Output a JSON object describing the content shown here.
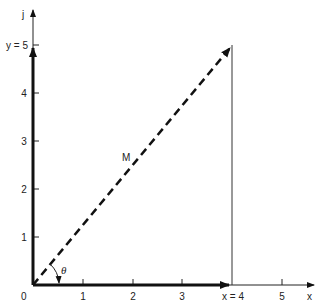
{
  "diagram": {
    "type": "vector-component-diagram",
    "axes": {
      "x_label": "x",
      "y_label": "j",
      "origin_label": "0",
      "x_ticks": [
        "1",
        "2",
        "3",
        "x = 4",
        "5"
      ],
      "y_ticks": [
        "1",
        "2",
        "3",
        "4",
        "y = 5"
      ]
    },
    "vector": {
      "label": "M",
      "x_component": 4,
      "y_component": 5,
      "style": "dashed"
    },
    "angle_label": "θ",
    "colors": {
      "ink": "#111111",
      "background": "#ffffff"
    }
  }
}
